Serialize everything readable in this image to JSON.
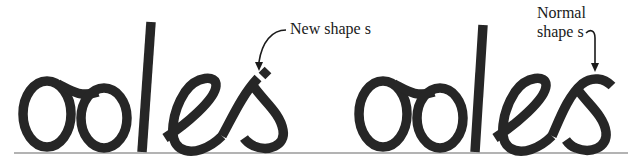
{
  "figure": {
    "words": [
      {
        "text": "odes",
        "variant": "new",
        "letters": [
          "o",
          "d",
          "e",
          "s"
        ]
      },
      {
        "text": "odes",
        "variant": "normal",
        "letters": [
          "o",
          "d",
          "e",
          "s"
        ]
      }
    ],
    "annotations": {
      "new": {
        "label": "New shape s",
        "points_to": "s in first word"
      },
      "normal": {
        "line1": "Normal",
        "line2": "shape s",
        "points_to": "s in second word"
      }
    },
    "colors": {
      "ink": "#262626",
      "baseline": "#9a9a9a",
      "background": "#ffffff"
    }
  }
}
